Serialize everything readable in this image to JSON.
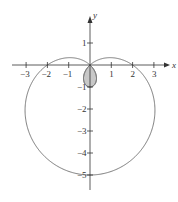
{
  "chart_data": {
    "type": "line",
    "title": "",
    "equation": "r = 2 - 3 sin(theta)",
    "curve_kind": "polar limacon with inner loop (inner loop shaded)",
    "xlabel": "x",
    "ylabel": "y",
    "xlim": [
      -3.5,
      3.6
    ],
    "ylim": [
      -5.3,
      2.5
    ],
    "x_ticks": [
      -3,
      -2,
      -1,
      1,
      2,
      3
    ],
    "x_tick_labels": [
      "-3",
      "-2",
      "-1",
      "1",
      "2",
      "3"
    ],
    "y_ticks": [
      1,
      -1,
      -2,
      -3,
      -4,
      -5
    ],
    "y_tick_labels": [
      "1",
      "-1",
      "-2",
      "-3",
      "-4",
      "-5"
    ],
    "key_points": [
      {
        "x": 2,
        "y": 0
      },
      {
        "x": -2,
        "y": 0
      },
      {
        "x": 0,
        "y": 0
      },
      {
        "x": 0,
        "y": -1
      },
      {
        "x": 0,
        "y": -5
      }
    ],
    "shaded_region": "inner loop between origin and (0,-1)",
    "grid": false,
    "legend": null,
    "colors": {
      "curve": "#777777",
      "fill": "#c8c8c8",
      "axes": "#333333"
    }
  }
}
